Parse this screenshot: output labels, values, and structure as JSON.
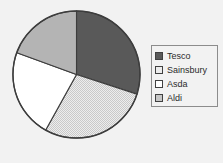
{
  "chart_data": {
    "type": "pie",
    "title": "",
    "categories": [
      "Tesco",
      "Sainsbury",
      "Asda",
      "Aldi"
    ],
    "values": [
      30,
      28,
      22.5,
      19.5
    ],
    "units": "percent",
    "start_angle_deg": 0,
    "direction": "clockwise",
    "legend_position": "right",
    "grid": false,
    "slices": [
      {
        "label": "Tesco",
        "value": 30,
        "start_deg": 0,
        "end_deg": 108,
        "color": "#595959",
        "pattern": "solid"
      },
      {
        "label": "Sainsbury",
        "value": 28,
        "start_deg": 108,
        "end_deg": 209,
        "color": "#d8d8d8",
        "pattern": "dotted"
      },
      {
        "label": "Asda",
        "value": 22.5,
        "start_deg": 209,
        "end_deg": 290,
        "color": "#ffffff",
        "pattern": "solid"
      },
      {
        "label": "Aldi",
        "value": 19.5,
        "start_deg": 290,
        "end_deg": 360,
        "color": "#b4b4b4",
        "pattern": "solid"
      }
    ]
  },
  "legend": {
    "items": [
      {
        "label": "Tesco",
        "color": "#595959"
      },
      {
        "label": "Sainsbury",
        "color": "#ececec"
      },
      {
        "label": "Asda",
        "color": "#ffffff"
      },
      {
        "label": "Aldi",
        "color": "#c6c6c6"
      }
    ]
  },
  "colors": {
    "background": "#f2f2f2",
    "outline": "#3d3d3d",
    "legend_border": "#8c8c8c",
    "text": "#2b2b2b"
  }
}
